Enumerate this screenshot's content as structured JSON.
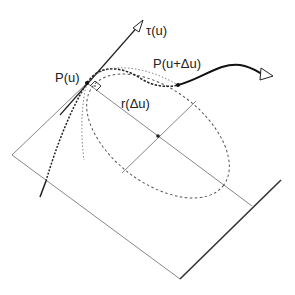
{
  "labels": {
    "tangent": "τ(u)",
    "point_p": "P(u)",
    "point_p_next": "P(u+Δu)",
    "radius": "r(Δu)"
  },
  "colors": {
    "ink": "#222222",
    "thin_line": "#888888",
    "background": "#ffffff"
  }
}
